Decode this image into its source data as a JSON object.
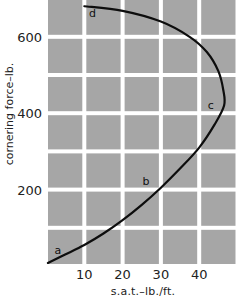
{
  "chart_data": {
    "type": "line",
    "title": "",
    "xlabel": "s.a.t.–lb./ft.",
    "ylabel": "cornering force–lb.",
    "x_ticks": [
      "10",
      "20",
      "30",
      "40"
    ],
    "y_ticks": [
      "200",
      "400",
      "600"
    ],
    "xlim": [
      0.5,
      50
    ],
    "ylim": [
      0,
      690
    ],
    "grid": true,
    "grid_style": "white lines on grey cells",
    "legend": null,
    "series": [
      {
        "name": "cornering force vs self-aligning torque",
        "points": [
          {
            "x": 0.5,
            "y": 8
          },
          {
            "x": 5,
            "y": 30
          },
          {
            "x": 10,
            "y": 55
          },
          {
            "x": 15,
            "y": 85
          },
          {
            "x": 20,
            "y": 120
          },
          {
            "x": 25,
            "y": 160
          },
          {
            "x": 30,
            "y": 205
          },
          {
            "x": 35,
            "y": 255
          },
          {
            "x": 40,
            "y": 310
          },
          {
            "x": 44,
            "y": 370
          },
          {
            "x": 46.5,
            "y": 420
          },
          {
            "x": 46.3,
            "y": 460
          },
          {
            "x": 45,
            "y": 510
          },
          {
            "x": 42,
            "y": 560
          },
          {
            "x": 37.5,
            "y": 600
          },
          {
            "x": 30,
            "y": 640
          },
          {
            "x": 20,
            "y": 668
          },
          {
            "x": 10,
            "y": 680
          }
        ]
      }
    ],
    "annotations": [
      {
        "text": "a",
        "x": 3,
        "y": 40
      },
      {
        "text": "b",
        "x": 26,
        "y": 220
      },
      {
        "text": "c",
        "x": 43,
        "y": 420
      },
      {
        "text": "d",
        "x": 12,
        "y": 660
      }
    ]
  },
  "colors": {
    "cell": "#a6a6a6",
    "gridline": "#ffffff",
    "curve": "#0d0d0d",
    "text": "#222222"
  }
}
